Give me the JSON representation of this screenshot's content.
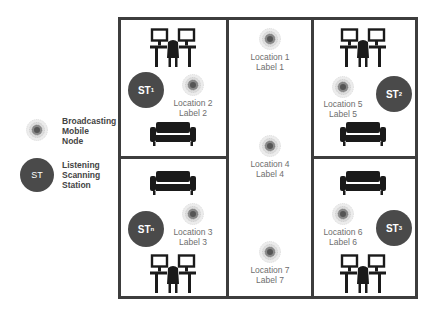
{
  "legend": {
    "broadcasting": {
      "icon": "broadcasting-node-icon",
      "lines": [
        "Broadcasting",
        "Mobile",
        "Node"
      ]
    },
    "listening": {
      "icon_text": "ST",
      "lines": [
        "Listening",
        "Scanning",
        "Station"
      ]
    }
  },
  "stations": [
    {
      "id": "st1",
      "main": "ST",
      "sub": "1"
    },
    {
      "id": "st2",
      "main": "ST",
      "sub": "2"
    },
    {
      "id": "stn",
      "main": "ST",
      "sub": "n"
    },
    {
      "id": "st3",
      "main": "ST",
      "sub": "3"
    }
  ],
  "locations": [
    {
      "name": "Location 1",
      "label": "Label 1"
    },
    {
      "name": "Location 2",
      "label": "Label 2"
    },
    {
      "name": "Location 3",
      "label": "Label 3"
    },
    {
      "name": "Location 4",
      "label": "Label 4"
    },
    {
      "name": "Location 5",
      "label": "Label 5"
    },
    {
      "name": "Location 6",
      "label": "Label 6"
    },
    {
      "name": "Location 7",
      "label": "Label 7"
    }
  ],
  "colors": {
    "wall": "#3d3d3d",
    "station": "#4a4a4a",
    "label": "#6e6e6e",
    "furniture": "#1a1a1a"
  }
}
